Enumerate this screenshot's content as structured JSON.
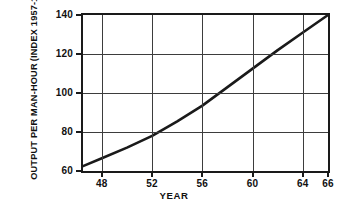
{
  "chart_data": {
    "type": "line",
    "title": "",
    "subtitle": "",
    "xlabel": "YEAR",
    "ylabel_line1": "OUTPUT PER MAN-HOUR",
    "ylabel_line2": "(INDEX 1957-1959 = 100)",
    "xlim": [
      46.5,
      66
    ],
    "ylim": [
      60,
      140
    ],
    "grid": true,
    "legend": "none",
    "xticks": [
      {
        "value": 48,
        "label": "48"
      },
      {
        "value": 52,
        "label": "52"
      },
      {
        "value": 56,
        "label": "56"
      },
      {
        "value": 60,
        "label": "60"
      },
      {
        "value": 64,
        "label": "64"
      },
      {
        "value": 66,
        "label": "66"
      }
    ],
    "yticks": [
      {
        "value": 60,
        "label": "60"
      },
      {
        "value": 80,
        "label": "80"
      },
      {
        "value": 100,
        "label": "100"
      },
      {
        "value": 120,
        "label": "120"
      },
      {
        "value": 140,
        "label": "140"
      }
    ],
    "gridlines_x": [
      48,
      52,
      56,
      60,
      64
    ],
    "gridlines_y": [
      80,
      100,
      120
    ],
    "series": [
      {
        "name": "Output per man-hour",
        "color": "#1a1a1a",
        "x": [
          46.5,
          48,
          50,
          52,
          54,
          56,
          58,
          60,
          62,
          64,
          66
        ],
        "values": [
          62.5,
          66.5,
          72.0,
          78.0,
          85.5,
          93.5,
          103.0,
          112.5,
          122.0,
          131.0,
          140.0
        ]
      }
    ],
    "annotations": []
  },
  "colors": {
    "background": "#ffffff",
    "axis": "#1a1a1a",
    "grid": "#3d3d3d",
    "series": "#1a1a1a",
    "text": "#111111"
  }
}
